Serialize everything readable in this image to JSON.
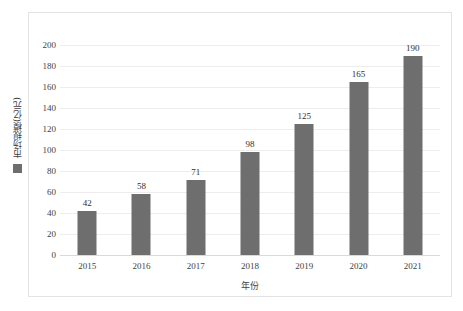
{
  "chart_data": {
    "type": "bar",
    "title": "",
    "subtitle": "",
    "xlabel": "年份",
    "ylabel": "市场规模(亿元)",
    "categories": [
      "2015",
      "2016",
      "2017",
      "2018",
      "2019",
      "2020",
      "2021"
    ],
    "values": [
      42,
      58,
      71,
      98,
      125,
      165,
      190
    ],
    "series": [
      {
        "name": "市场规模(亿元)",
        "values": [
          42,
          58,
          71,
          98,
          125,
          165,
          190
        ],
        "color": "#6e6e6e"
      }
    ],
    "data_labels": [
      "42",
      "58",
      "71",
      "98",
      "125",
      "165",
      "190"
    ],
    "ylim": [
      0,
      200
    ],
    "ytick_interval": 20,
    "ytick_labels": [
      "200",
      "180",
      "160",
      "140",
      "120",
      "100",
      "80",
      "60",
      "40",
      "20",
      "0"
    ],
    "ytick_values": [
      200,
      180,
      160,
      140,
      120,
      100,
      80,
      60,
      40,
      20,
      0
    ],
    "grid": true,
    "grid_axis": "y",
    "legend_position": "left-vertical",
    "legend_entries": [
      {
        "label": "市场规模(亿元)",
        "color": "#6e6e6e"
      }
    ],
    "colors": {
      "bar": "#6e6e6e",
      "gridline": "#ededed",
      "baseline": "#d9d9d9",
      "frame": "#e3e3e3",
      "background": "#ffffff",
      "text": "#3f3f3f"
    }
  }
}
